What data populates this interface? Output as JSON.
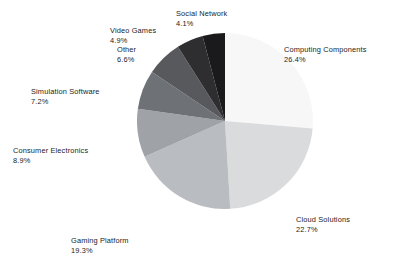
{
  "chart_data": {
    "type": "pie",
    "title": "",
    "subtitle": "",
    "xlabel": "",
    "ylabel": "",
    "grid": false,
    "legend_position": "none",
    "label_format": "name above percentage",
    "start_angle_deg": 90,
    "direction": "clockwise",
    "background_color": "#ffffff",
    "label_text_color": "#1c1c1c",
    "categories": [
      "Computing Components",
      "Cloud Solutions",
      "Gaming Platform",
      "Consumer Electronics",
      "Simulation Software",
      "Other",
      "Video Games",
      "Social Network"
    ],
    "values": [
      26.4,
      22.7,
      19.3,
      8.9,
      7.2,
      6.6,
      4.9,
      4.1
    ],
    "value_labels": [
      "26.4%",
      "22.7%",
      "19.3%",
      "8.9%",
      "7.2%",
      "6.6%",
      "4.9%",
      "4.1%"
    ],
    "colors": [
      "#f7f7f7",
      "#d9dbdd",
      "#b9bcc0",
      "#9fa2a6",
      "#6e7276",
      "#58595c",
      "#2e2e30",
      "#1a1a1c"
    ],
    "slices": [
      {
        "name": "Computing Components",
        "value": 26.4,
        "value_label": "26.4%",
        "color": "#f7f7f7"
      },
      {
        "name": "Cloud Solutions",
        "value": 22.7,
        "value_label": "22.7%",
        "color": "#d9dbdd"
      },
      {
        "name": "Gaming Platform",
        "value": 19.3,
        "value_label": "19.3%",
        "color": "#b9bcc0"
      },
      {
        "name": "Consumer Electronics",
        "value": 8.9,
        "value_label": "8.9%",
        "color": "#9fa2a6"
      },
      {
        "name": "Simulation Software",
        "value": 7.2,
        "value_label": "7.2%",
        "color": "#6e7276"
      },
      {
        "name": "Other",
        "value": 6.6,
        "value_label": "6.6%",
        "color": "#58595c"
      },
      {
        "name": "Video Games",
        "value": 4.9,
        "value_label": "4.9%",
        "color": "#2e2e30"
      },
      {
        "name": "Social Network",
        "value": 4.1,
        "value_label": "4.1%",
        "color": "#1a1a1c"
      }
    ],
    "total": 100.1
  }
}
